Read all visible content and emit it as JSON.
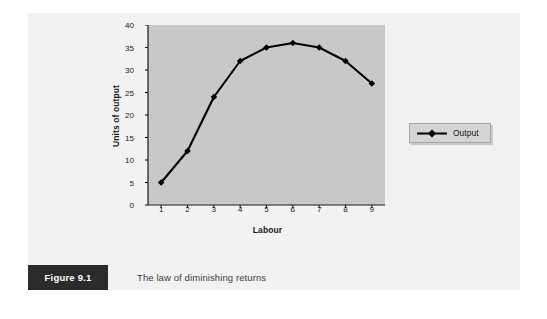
{
  "figure": {
    "number_label": "Figure 9.1",
    "caption": "The law of diminishing returns"
  },
  "legend": {
    "entry_label": "Output",
    "marker": "diamond-marker-icon",
    "position": "right"
  },
  "colors": {
    "panel_background": "#f2f2f2",
    "plot_background": "#c8c8c8",
    "series_line": "#000000",
    "axis": "#1a1a1a",
    "caption_box": "#2b2b2b",
    "legend_background": "#d4d4d4"
  },
  "chart_data": {
    "type": "line",
    "title": "",
    "xlabel": "Labour",
    "ylabel": "Units of output",
    "x": [
      1,
      2,
      3,
      4,
      5,
      6,
      7,
      8,
      9
    ],
    "xtick_labels": [
      "1",
      "2",
      "3",
      "4",
      "5",
      "6",
      "7",
      "8",
      "9"
    ],
    "ytick_labels": [
      "0",
      "5",
      "10",
      "15",
      "20",
      "25",
      "30",
      "35",
      "40"
    ],
    "yticks": [
      0,
      5,
      10,
      15,
      20,
      25,
      30,
      35,
      40
    ],
    "xlim": [
      0.5,
      9.5
    ],
    "ylim": [
      0,
      40
    ],
    "grid": false,
    "legend_position": "right",
    "series": [
      {
        "name": "Output",
        "values": [
          5,
          12,
          24,
          32,
          35,
          36,
          35,
          32,
          27
        ],
        "marker": "diamond",
        "color": "#000000"
      }
    ]
  }
}
